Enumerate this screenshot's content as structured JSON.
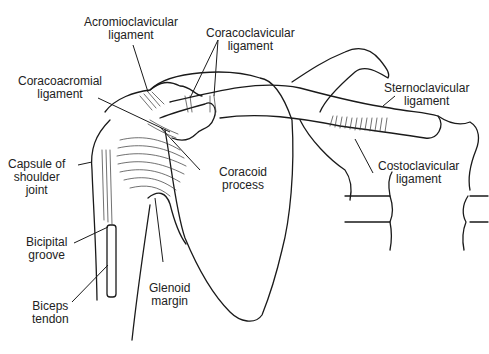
{
  "figure": {
    "labels": [
      {
        "id": "acromioclavicular",
        "lines": [
          "Acromioclavicular",
          "ligament"
        ]
      },
      {
        "id": "coracoclavicular",
        "lines": [
          "Coracoclavicular",
          "ligament"
        ]
      },
      {
        "id": "coracoacromial",
        "lines": [
          "Coracoacromial",
          "ligament"
        ]
      },
      {
        "id": "sternoclavicular",
        "lines": [
          "Sternoclavicular",
          "ligament"
        ]
      },
      {
        "id": "capsule",
        "lines": [
          "Capsule of",
          "shoulder",
          "joint"
        ]
      },
      {
        "id": "coracoid",
        "lines": [
          "Coracoid",
          "process"
        ]
      },
      {
        "id": "costoclavicular",
        "lines": [
          "Costoclavicular",
          "ligament"
        ]
      },
      {
        "id": "bicipital",
        "lines": [
          "Bicipital",
          "groove"
        ]
      },
      {
        "id": "glenoid",
        "lines": [
          "Glenoid",
          "margin"
        ]
      },
      {
        "id": "biceps",
        "lines": [
          "Biceps",
          "tendon"
        ]
      }
    ]
  }
}
